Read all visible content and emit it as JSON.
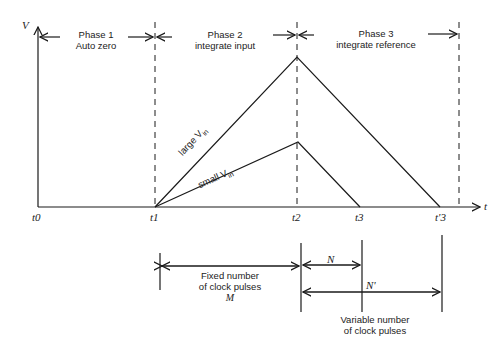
{
  "axes": {
    "y_label": "V",
    "x_label": "t",
    "time_marks": [
      "t0",
      "t1",
      "t2",
      "t3",
      "t'3"
    ]
  },
  "phases": [
    {
      "name": "Phase 1",
      "desc": "Auto zero"
    },
    {
      "name": "Phase 2",
      "desc": "integrate input"
    },
    {
      "name": "Phase 3",
      "desc": "integrate reference"
    }
  ],
  "ramps": {
    "large": {
      "label": "large V",
      "sub": "in"
    },
    "small": {
      "label": "small V",
      "sub": "in"
    }
  },
  "counts": {
    "fixed_line1": "Fixed number",
    "fixed_line2": "of clock pulses",
    "fixed_symbol": "M",
    "n_symbol": "N",
    "n_prime_symbol": "N'",
    "variable_line1": "Variable number",
    "variable_line2": "of clock pulses"
  },
  "colors": {
    "stroke": "#1a1a1a",
    "background": "#ffffff"
  }
}
